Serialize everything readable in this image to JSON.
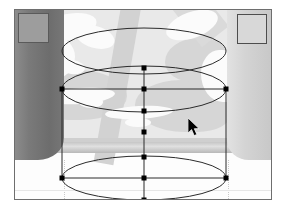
{
  "app": {
    "view_label": "3D model fitting viewport",
    "background_label": "reference photograph"
  },
  "scene": {
    "photo": {
      "name": "photo-backdrop",
      "upper_tone": "#e9e9e9",
      "lower_tone": "#fdfdfd",
      "stripe_tone": "#d2d2d2",
      "shadow_tone": "#d6d6d6",
      "highlight_tone": "#fbfbfb"
    },
    "pillar_left": {
      "name": "pillar-left",
      "tone": "#6d6d6d",
      "cap_tone": "#9d9d9d"
    },
    "pillar_right": {
      "name": "pillar-right",
      "tone": "#d4d4d4",
      "cap_tone": "#d8d8d8"
    },
    "counter_band": {
      "name": "counter-edge",
      "tone": "#c6c6c6"
    }
  },
  "wireframe": {
    "stroke_color": "#2b2b2b",
    "stroke_width": 1,
    "handle_color": "#000000",
    "handle_size": 5,
    "ellipses": [
      {
        "name": "top-ellipse",
        "cx": 129,
        "cy": 41,
        "rx": 82,
        "ry": 23
      },
      {
        "name": "middle-ellipse",
        "cx": 129,
        "cy": 79,
        "rx": 82,
        "ry": 23
      },
      {
        "name": "bottom-ellipse",
        "cx": 129,
        "cy": 168,
        "rx": 82,
        "ry": 22
      }
    ],
    "bounding_box": {
      "name": "selection-bounds",
      "x": 47,
      "y": 79,
      "width": 164,
      "height": 89
    },
    "center_axis": {
      "name": "vertical-axis",
      "x": 129,
      "y1": 58,
      "y2": 190
    },
    "handles": [
      {
        "name": "handle-top-ellipse-bottom",
        "x": 129,
        "y": 58
      },
      {
        "name": "handle-bounds-top-left",
        "x": 47,
        "y": 79
      },
      {
        "name": "handle-bounds-top-center",
        "x": 129,
        "y": 79
      },
      {
        "name": "handle-bounds-top-right",
        "x": 211,
        "y": 79
      },
      {
        "name": "handle-middle-ellipse-bottom",
        "x": 129,
        "y": 101
      },
      {
        "name": "handle-axis-midpoint",
        "x": 129,
        "y": 122
      },
      {
        "name": "handle-bottom-ellipse-top",
        "x": 129,
        "y": 147
      },
      {
        "name": "handle-bounds-bottom-left",
        "x": 47,
        "y": 168
      },
      {
        "name": "handle-bounds-bottom-center",
        "x": 129,
        "y": 168
      },
      {
        "name": "handle-bounds-bottom-right",
        "x": 211,
        "y": 168
      },
      {
        "name": "handle-bottom-ellipse-bottom",
        "x": 129,
        "y": 190
      }
    ]
  },
  "cursor": {
    "name": "mouse-pointer",
    "x": 173,
    "y": 108,
    "color": "#000000"
  },
  "frame": {
    "name": "canvas-frame",
    "border_color": "#6e6e6e"
  }
}
